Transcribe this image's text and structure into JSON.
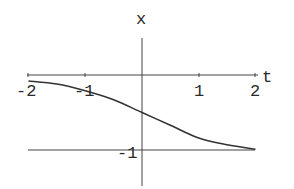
{
  "chart_data": {
    "type": "line",
    "title": "",
    "xlabel": "t",
    "ylabel": "x",
    "xlim": [
      -2,
      2
    ],
    "ylim": [
      -1.4,
      0.5
    ],
    "x_ticks": [
      -2,
      -1,
      1,
      2
    ],
    "x_tick_labels": [
      "-2",
      "-1",
      "1",
      "2"
    ],
    "y_ticks": [
      -1
    ],
    "y_tick_labels": [
      "-1"
    ],
    "grid": false,
    "reference_lines": [
      {
        "orientation": "horizontal",
        "y": -1
      }
    ],
    "series": [
      {
        "name": "x(t)",
        "x": [
          -2,
          -1.5,
          -1,
          -0.5,
          0,
          0.5,
          1,
          1.5,
          2
        ],
        "values": [
          -0.08,
          -0.12,
          -0.21,
          -0.33,
          -0.5,
          -0.67,
          -0.84,
          -0.93,
          -0.99
        ]
      }
    ]
  },
  "colors": {
    "axis": "#333333",
    "curve": "#333333",
    "background": "#ffffff"
  }
}
